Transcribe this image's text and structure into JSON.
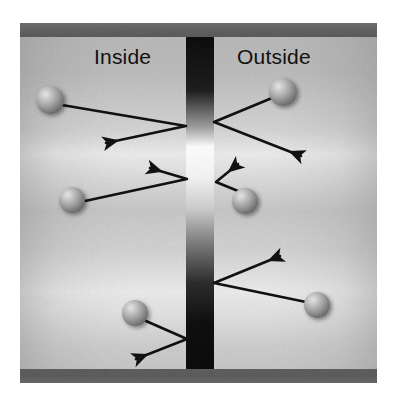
{
  "figure": {
    "labels": {
      "inside": "Inside",
      "outside": "Outside"
    },
    "colors": {
      "background": "#ffffff",
      "chamber_fill": "#b4b4b4",
      "chamber_highlight": "#e8e8e8",
      "wall_band": "#5a5a5a",
      "barrier_dark": "#0a0a0a",
      "barrier_light": "#fbfbfb",
      "sphere_light": "#d8d8d8",
      "sphere_dark": "#5c5c5c",
      "arrow_stroke": "#111111",
      "text": "#111111"
    },
    "frame": {
      "x": 20,
      "y": 23,
      "width": 357,
      "height": 360
    },
    "walls": [
      {
        "name": "top-wall",
        "x": 20,
        "y": 23,
        "width": 357,
        "height": 14
      },
      {
        "name": "bottom-wall",
        "x": 20,
        "y": 369,
        "width": 357,
        "height": 14
      }
    ],
    "barrier": {
      "name": "membrane-barrier",
      "x": 186,
      "y": 37,
      "width": 28,
      "height": 332,
      "gradient_stops": [
        {
          "offset": 0.0,
          "color": "#0a0a0a"
        },
        {
          "offset": 0.16,
          "color": "#1a1a1a"
        },
        {
          "offset": 0.27,
          "color": "#9a9a9a"
        },
        {
          "offset": 0.33,
          "color": "#fbfbfb"
        },
        {
          "offset": 0.42,
          "color": "#f2f2f2"
        },
        {
          "offset": 0.52,
          "color": "#c9c9c9"
        },
        {
          "offset": 0.62,
          "color": "#7a7a7a"
        },
        {
          "offset": 0.74,
          "color": "#2a2a2a"
        },
        {
          "offset": 0.86,
          "color": "#0c0c0c"
        },
        {
          "offset": 1.0,
          "color": "#080808"
        }
      ]
    },
    "particles": [
      {
        "name": "particle-inside-top",
        "cx": 50,
        "cy": 100,
        "r": 14,
        "region": "inside"
      },
      {
        "name": "particle-outside-top",
        "cx": 283,
        "cy": 92,
        "r": 14,
        "region": "outside"
      },
      {
        "name": "particle-inside-middle",
        "cx": 72,
        "cy": 200,
        "r": 13,
        "region": "inside"
      },
      {
        "name": "particle-outside-middle",
        "cx": 245,
        "cy": 201,
        "r": 13,
        "region": "outside"
      },
      {
        "name": "particle-inside-bottom",
        "cx": 135,
        "cy": 313,
        "r": 13,
        "region": "inside"
      },
      {
        "name": "particle-outside-bottom",
        "cx": 317,
        "cy": 305,
        "r": 13,
        "region": "outside"
      }
    ],
    "trajectories": [
      {
        "name": "trajectory-inside-top",
        "region": "inside",
        "points": [
          [
            62,
            105
          ],
          [
            186,
            126
          ],
          [
            106,
            143
          ]
        ],
        "arrow_at": [
          106,
          143
        ]
      },
      {
        "name": "trajectory-outside-top",
        "region": "outside",
        "points": [
          [
            272,
            98
          ],
          [
            214,
            122
          ],
          [
            301,
            156
          ]
        ],
        "arrow_at": [
          301,
          156
        ]
      },
      {
        "name": "trajectory-inside-middle",
        "region": "inside",
        "points": [
          [
            85,
            201
          ],
          [
            187,
            179
          ],
          [
            150,
            168
          ]
        ],
        "arrow_at": [
          150,
          168
        ]
      },
      {
        "name": "trajectory-outside-middle",
        "region": "outside",
        "points": [
          [
            238,
            191
          ],
          [
            216,
            182
          ],
          [
            238,
            164
          ]
        ],
        "arrow_at": [
          238,
          164
        ]
      },
      {
        "name": "trajectory-inside-bottom",
        "region": "inside",
        "points": [
          [
            146,
            321
          ],
          [
            187,
            339
          ],
          [
            136,
            359
          ]
        ],
        "arrow_at": [
          136,
          359
        ]
      },
      {
        "name": "trajectory-outside-bottom",
        "region": "outside",
        "points": [
          [
            306,
            302
          ],
          [
            214,
            283
          ],
          [
            280,
            256
          ]
        ],
        "arrow_at": [
          280,
          256
        ]
      }
    ]
  }
}
